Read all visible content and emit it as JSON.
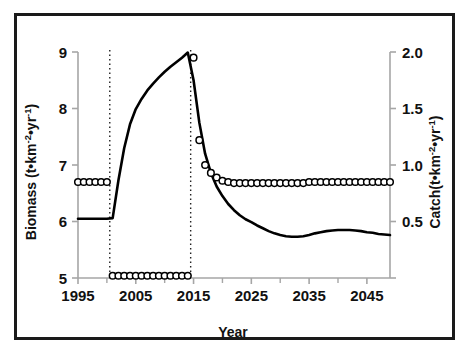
{
  "figure": {
    "background_color": "#ffffff",
    "frame_color": "#1a1a1a",
    "series_color": "#000000",
    "axis_color": "#a6a6a6"
  },
  "chart_data": {
    "type": "line",
    "title": "",
    "xlabel": "Year",
    "ylabel": "Biomass (t•km⁻²•yr⁻¹)",
    "y2label": "Catch(t•km⁻²•yr⁻¹)",
    "xlim": [
      1995,
      2049
    ],
    "ylim": [
      5,
      9
    ],
    "y2lim": [
      0.0,
      2.0
    ],
    "grid": false,
    "legend": "none",
    "xticks": [
      1995,
      2005,
      2015,
      2025,
      2035,
      2045
    ],
    "xtick_labels": [
      "1995",
      "2005",
      "2015",
      "2025",
      "2035",
      "2045"
    ],
    "xminor_ticks": [
      2000,
      2010,
      2020,
      2030,
      2040
    ],
    "yticks": [
      5,
      6,
      7,
      8,
      9
    ],
    "ytick_labels": [
      "5",
      "6",
      "7",
      "8",
      "9"
    ],
    "y2ticks": [
      0.0,
      0.5,
      1.0,
      1.5,
      2.0
    ],
    "y2tick_labels": [
      "",
      "0.5",
      "1.0",
      "1.5",
      "2.0"
    ],
    "annotations": [
      {
        "name": "closure-start-dropline",
        "x": 2000.5,
        "style": "dotted"
      },
      {
        "name": "reopening-dropline",
        "x": 2014.5,
        "style": "dotted"
      }
    ],
    "x": [
      1995,
      1996,
      1997,
      1998,
      1999,
      2000,
      2001,
      2002,
      2003,
      2004,
      2005,
      2006,
      2007,
      2008,
      2009,
      2010,
      2011,
      2012,
      2013,
      2014,
      2015,
      2016,
      2017,
      2018,
      2019,
      2020,
      2021,
      2022,
      2023,
      2024,
      2025,
      2026,
      2027,
      2028,
      2029,
      2030,
      2031,
      2032,
      2033,
      2034,
      2035,
      2036,
      2037,
      2038,
      2039,
      2040,
      2041,
      2042,
      2043,
      2044,
      2045,
      2046,
      2047,
      2048,
      2049
    ],
    "series": [
      {
        "name": "Biomass",
        "axis": "left",
        "marker": "none",
        "linestyle": "solid",
        "color": "#000000",
        "values": [
          6.05,
          6.05,
          6.05,
          6.05,
          6.05,
          6.05,
          6.06,
          6.73,
          7.3,
          7.72,
          7.99,
          8.17,
          8.32,
          8.44,
          8.55,
          8.65,
          8.74,
          8.82,
          8.9,
          8.99,
          8.5,
          7.75,
          7.2,
          6.86,
          6.62,
          6.45,
          6.31,
          6.2,
          6.11,
          6.04,
          5.99,
          5.93,
          5.88,
          5.83,
          5.79,
          5.76,
          5.74,
          5.73,
          5.73,
          5.74,
          5.76,
          5.79,
          5.81,
          5.83,
          5.84,
          5.85,
          5.85,
          5.85,
          5.84,
          5.83,
          5.81,
          5.8,
          5.78,
          5.77,
          5.76
        ]
      },
      {
        "name": "Catch",
        "axis": "right",
        "marker": "open-circle",
        "linestyle": "none",
        "color": "#000000",
        "values": [
          0.85,
          0.85,
          0.85,
          0.85,
          0.85,
          0.85,
          0.02,
          0.02,
          0.02,
          0.02,
          0.02,
          0.02,
          0.02,
          0.02,
          0.02,
          0.02,
          0.02,
          0.02,
          0.02,
          0.02,
          1.95,
          1.22,
          1.0,
          0.93,
          0.89,
          0.86,
          0.85,
          0.84,
          0.84,
          0.84,
          0.84,
          0.84,
          0.84,
          0.84,
          0.84,
          0.84,
          0.84,
          0.84,
          0.84,
          0.84,
          0.85,
          0.85,
          0.85,
          0.85,
          0.85,
          0.85,
          0.85,
          0.85,
          0.85,
          0.85,
          0.85,
          0.85,
          0.85,
          0.85,
          0.85
        ]
      }
    ]
  }
}
